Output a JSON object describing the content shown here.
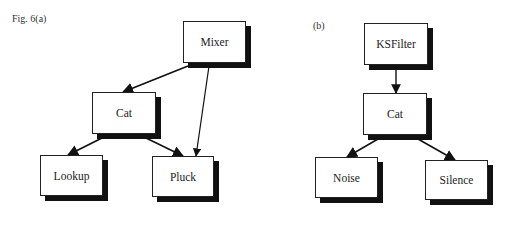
{
  "figure": {
    "label_a": "Fig. 6(a)",
    "label_b": "(b)"
  },
  "diagram_a": {
    "nodes": [
      {
        "id": "mixer",
        "label": "Mixer",
        "x": 183,
        "y": 21,
        "w": 63,
        "h": 42
      },
      {
        "id": "cat_a",
        "label": "Cat",
        "x": 92,
        "y": 92,
        "w": 64,
        "h": 42
      },
      {
        "id": "lookup",
        "label": "Lookup",
        "x": 40,
        "y": 155,
        "w": 63,
        "h": 41
      },
      {
        "id": "pluck",
        "label": "Pluck",
        "x": 152,
        "y": 156,
        "w": 62,
        "h": 41
      }
    ],
    "edges": [
      {
        "from": "Mixer",
        "to": "Cat"
      },
      {
        "from": "Mixer",
        "to": "Pluck"
      },
      {
        "from": "Cat",
        "to": "Lookup"
      },
      {
        "from": "Cat",
        "to": "Pluck"
      }
    ]
  },
  "diagram_b": {
    "nodes": [
      {
        "id": "ksfilter",
        "label": "KSFilter",
        "x": 364,
        "y": 23,
        "w": 64,
        "h": 42
      },
      {
        "id": "cat_b",
        "label": "Cat",
        "x": 363,
        "y": 93,
        "w": 64,
        "h": 42
      },
      {
        "id": "noise",
        "label": "Noise",
        "x": 315,
        "y": 157,
        "w": 63,
        "h": 41
      },
      {
        "id": "silence",
        "label": "Silence",
        "x": 425,
        "y": 160,
        "w": 63,
        "h": 40
      }
    ],
    "edges": [
      {
        "from": "KSFilter",
        "to": "Cat"
      },
      {
        "from": "Cat",
        "to": "Noise"
      },
      {
        "from": "Cat",
        "to": "Silence"
      }
    ]
  }
}
